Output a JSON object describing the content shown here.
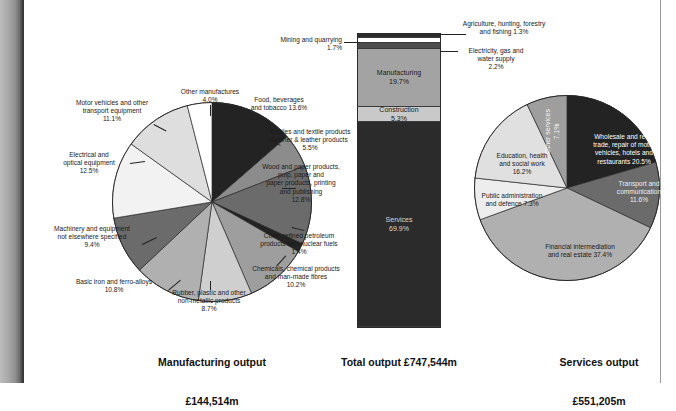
{
  "colors": {
    "black": "#232323",
    "very_dark": "#2b2b2b",
    "dark_gray": "#4d4d4d",
    "mid_dark_gray": "#6b6b6b",
    "mid_gray": "#8c8c8c",
    "gray": "#a3a3a3",
    "light_gray": "#bdbdbd",
    "lighter_gray": "#d4d4d4",
    "near_white": "#ececec",
    "white": "#ffffff",
    "outline": "#2a2a2a",
    "text": "#1b1b1b"
  },
  "charts": [
    {
      "id": "manufacturing-output",
      "type": "pie",
      "title": "Manufacturing output",
      "subtitle": "£144,514m",
      "total_label": "£144,514m",
      "unit": "%",
      "categories": [
        "Food, beverages and tobacco",
        "Textiles and textile products leather & leather products",
        "Wood and paper products, pulp, paper and paper products, printing and publishing",
        "Coke, refined petroleum products and nuclear fuels",
        "Chemicals, chemical products and man-made fibres",
        "Rubber, plastic and other non-metallic products",
        "Basic iron and ferro-alloys",
        "Machinery and equipment not elsewhere specified",
        "Electrical and optical equipment",
        "Motor vehicles and other transport equipment",
        "Other manufactures"
      ],
      "values": [
        13.6,
        5.5,
        12.8,
        1.4,
        10.2,
        8.7,
        10.8,
        9.4,
        12.5,
        11.1,
        4.0
      ],
      "slice_colors": [
        "#232323",
        "#8c8c8c",
        "#6b6b6b",
        "#232323",
        "#9e9e9e",
        "#cfcfcf",
        "#b0b0b0",
        "#6b6b6b",
        "#f2f2f2",
        "#dedede",
        "#ffffff"
      ],
      "labels": [
        {
          "text": "Food, beverages\nand tobacco 13.6%",
          "value": 13.6
        },
        {
          "text": "Textiles and textile products\nleather & leather products\n5.5%",
          "value": 5.5
        },
        {
          "text": "Wood and paper products,\npulp, paper and\npaper products, printing\nand publishing\n12.8%",
          "value": 12.8
        },
        {
          "text": "Coke, refined petroleum\nproducts and nuclear fuels\n1.4%",
          "value": 1.4
        },
        {
          "text": "Chemicals, chemical products\nand man-made fibres\n10.2%",
          "value": 10.2
        },
        {
          "text": "Rubber, plastic and other\nnon-metallic products\n8.7%",
          "value": 8.7
        },
        {
          "text": "Basic iron and ferro-alloys\n10.8%",
          "value": 10.8
        },
        {
          "text": "Machinery and equipment\nnot elsewhere specified\n9.4%",
          "value": 9.4
        },
        {
          "text": "Electrical and\noptical equipment\n12.5%",
          "value": 12.5
        },
        {
          "text": "Motor vehicles and other\ntransport equipment\n11.1%",
          "value": 11.1
        },
        {
          "text": "Other manufactures\n4.0%",
          "value": 4.0
        }
      ]
    },
    {
      "id": "total-output",
      "type": "bar",
      "title": "Total output £747,544m",
      "subtitle": "",
      "total_label": "£747,544m",
      "unit": "%",
      "stacked": true,
      "categories": [
        "Agriculture, hunting, forestry and fishing",
        "Mining and quarrying",
        "Electricity, gas and water supply",
        "Manufacturing",
        "Construction",
        "Services"
      ],
      "values": [
        1.3,
        1.7,
        2.2,
        19.7,
        5.3,
        69.8
      ],
      "segment_colors": [
        "#2b2b2b",
        "#ffffff",
        "#4d4d4d",
        "#a3a3a3",
        "#c9c9c9",
        "#2b2b2b"
      ],
      "inside_labels": [
        {
          "text": "",
          "value": 1.3
        },
        {
          "text": "",
          "value": 1.7
        },
        {
          "text": "",
          "value": 2.2
        },
        {
          "text": "Manufacturing\n19.7%",
          "value": 19.7
        },
        {
          "text": "Construction\n5.3%",
          "value": 5.3
        },
        {
          "text": "Services\n69.9%",
          "value": 69.8
        }
      ],
      "callouts": [
        {
          "text": "Mining and quarrying\n1.7%",
          "side": "left"
        },
        {
          "text": "Agriculture, hunting, forestry\nand fishing 1.3%",
          "side": "right"
        },
        {
          "text": "Electricity, gas and\nwater supply\n2.2%",
          "side": "right"
        }
      ]
    },
    {
      "id": "services-output",
      "type": "pie",
      "title": "Services output",
      "subtitle": "£551,205m",
      "total_label": "£551,205m",
      "unit": "%",
      "categories": [
        "Wholesale and retail trade, repair of motor vehicles, hotels and restaurants",
        "Transport and communication",
        "Financial intermediation and real estate",
        "Public administration and defence",
        "Education, health and social work",
        "Other services"
      ],
      "values": [
        20.5,
        11.6,
        37.4,
        7.3,
        16.2,
        7.1
      ],
      "slice_colors": [
        "#232323",
        "#6b6b6b",
        "#b0b0b0",
        "#ededed",
        "#e0e0e0",
        "#9e9e9e"
      ],
      "labels": [
        {
          "text": "Wholesale and retail\ntrade, repair of motor\nvehicles, hotels and\nrestaurants 20.5%",
          "value": 20.5
        },
        {
          "text": "Transport and\ncommunication\n11.6%",
          "value": 11.6
        },
        {
          "text": "Financial intermediation\nand real estate 37.4%",
          "value": 37.4
        },
        {
          "text": "Public administration\nand defence 7.3%",
          "value": 7.3
        },
        {
          "text": "Education, health\nand social work\n16.2%",
          "value": 16.2
        },
        {
          "text": "Other services\n7.1%",
          "value": 7.1
        }
      ]
    }
  ],
  "chart_data": [
    {
      "type": "pie",
      "title": "Manufacturing output",
      "subtitle": "£144,514m",
      "xlabel": "",
      "ylabel": "",
      "legend": "none",
      "grid": false,
      "categories": [
        "Food, beverages and tobacco",
        "Textiles and textile products leather & leather products",
        "Wood and paper products, pulp, paper and paper products, printing and publishing",
        "Coke, refined petroleum products and nuclear fuels",
        "Chemicals, chemical products and man-made fibres",
        "Rubber, plastic and other non-metallic products",
        "Basic iron and ferro-alloys",
        "Machinery and equipment not elsewhere specified",
        "Electrical and optical equipment",
        "Motor vehicles and other transport equipment",
        "Other manufactures"
      ],
      "values": [
        13.6,
        5.5,
        12.8,
        1.4,
        10.2,
        8.7,
        10.8,
        9.4,
        12.5,
        11.1,
        4.0
      ]
    },
    {
      "type": "bar",
      "title": "Total output £747,544m",
      "xlabel": "",
      "ylabel": "",
      "legend": "none",
      "grid": false,
      "stacked": true,
      "ylim": [
        0,
        100
      ],
      "categories": [
        "Agriculture, hunting, forestry and fishing",
        "Mining and quarrying",
        "Electricity, gas and water supply",
        "Manufacturing",
        "Construction",
        "Services"
      ],
      "values": [
        1.3,
        1.7,
        2.2,
        19.7,
        5.3,
        69.8
      ]
    },
    {
      "type": "pie",
      "title": "Services output",
      "subtitle": "£551,205m",
      "xlabel": "",
      "ylabel": "",
      "legend": "none",
      "grid": false,
      "categories": [
        "Wholesale and retail trade, repair of motor vehicles, hotels and restaurants",
        "Transport and communication",
        "Financial intermediation and real estate",
        "Public administration and defence",
        "Education, health and social work",
        "Other services"
      ],
      "values": [
        20.5,
        11.6,
        37.4,
        7.3,
        16.2,
        7.1
      ]
    }
  ]
}
